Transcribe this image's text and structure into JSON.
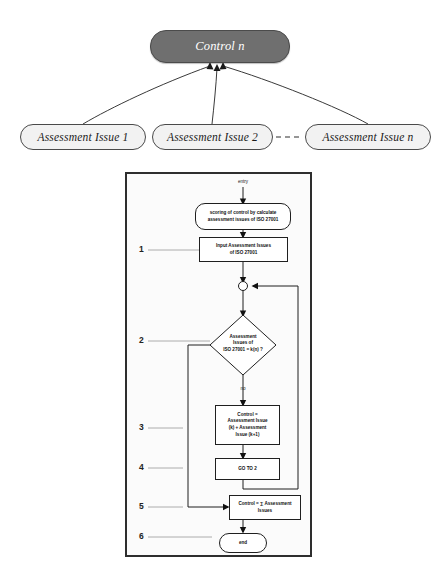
{
  "figure": {
    "title_node": "Control n",
    "issue_nodes": [
      {
        "label": "Assessment Issue 1"
      },
      {
        "label": "Assessment Issue 2"
      },
      {
        "label": "Assessment Issue n"
      }
    ]
  },
  "flowchart": {
    "entry_label": "entry",
    "end_label": "end",
    "no_label": "no",
    "steps": [
      {
        "num": "1",
        "text": "Input Assessment Issues of ISO 27001"
      },
      {
        "num": "2",
        "text": "Assessment Issues of ISO 27001 = k(n) ?"
      },
      {
        "num": "3",
        "text": "Control = Assessment Issue (k) + Assessment Issue (k+1)"
      },
      {
        "num": "4",
        "text": "GO TO 2"
      },
      {
        "num": "5",
        "text": "Control = ∑ Assessment Issues"
      },
      {
        "num": "6",
        "text": "end"
      }
    ],
    "scoring_box": {
      "line1": "scoring of control by calculate",
      "line2": "assessment issues of ISO 27001"
    },
    "input_box": {
      "line1": "Input Assessment Issues",
      "line2": "of ISO 27001"
    },
    "decision_box": {
      "line1": "Assessment",
      "line2": "Issues of",
      "line3": "ISO 27001 = k(n) ?"
    },
    "process_box": {
      "line1": "Control =",
      "line2": "Assessment Issue",
      "line3": "(k) + Assessment",
      "line4": "Issue (k+1)"
    },
    "goto_box": {
      "line1": "GO TO 2"
    },
    "sum_box": {
      "line1": "Control = ∑ Assessment",
      "line2": "Issues"
    },
    "row_numbers": [
      "1",
      "2",
      "3",
      "4",
      "5",
      "6"
    ]
  },
  "colors": {
    "control_fill": "#6f6f6f",
    "issue_fill": "#f2f2f2",
    "panel_fill": "#fbfbfb",
    "stroke": "#2e2e2e"
  }
}
